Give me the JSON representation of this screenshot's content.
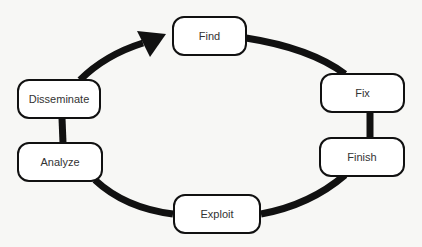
{
  "diagram": {
    "type": "cycle",
    "direction": "clockwise",
    "colors": {
      "edge": "#111111",
      "node_border": "#111111",
      "node_fill": "#ffffff",
      "text": "#333333",
      "background": "#f7f7f5"
    },
    "nodes": [
      {
        "id": "find",
        "label": "Find"
      },
      {
        "id": "fix",
        "label": "Fix"
      },
      {
        "id": "finish",
        "label": "Finish"
      },
      {
        "id": "exploit",
        "label": "Exploit"
      },
      {
        "id": "analyze",
        "label": "Analyze"
      },
      {
        "id": "disseminate",
        "label": "Disseminate"
      }
    ],
    "edges": [
      {
        "from": "find",
        "to": "fix"
      },
      {
        "from": "fix",
        "to": "finish"
      },
      {
        "from": "finish",
        "to": "exploit"
      },
      {
        "from": "exploit",
        "to": "analyze"
      },
      {
        "from": "analyze",
        "to": "disseminate"
      },
      {
        "from": "disseminate",
        "to": "find",
        "arrow": true
      }
    ]
  }
}
